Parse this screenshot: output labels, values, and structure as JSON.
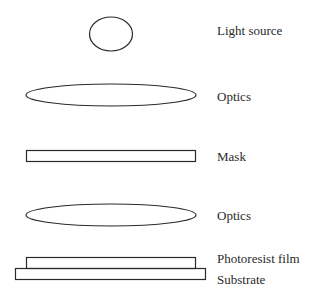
{
  "diagram": {
    "stroke_color": "#2a2a2a",
    "components": [
      {
        "id": "light-source",
        "label": "Light source",
        "shape": "circle"
      },
      {
        "id": "optics-upper",
        "label": "Optics",
        "shape": "ellipse"
      },
      {
        "id": "mask",
        "label": "Mask",
        "shape": "rectangle"
      },
      {
        "id": "optics-lower",
        "label": "Optics",
        "shape": "ellipse"
      },
      {
        "id": "photoresist-film",
        "label": "Photoresist film",
        "shape": "rectangle"
      },
      {
        "id": "substrate",
        "label": "Substrate",
        "shape": "rectangle"
      }
    ]
  }
}
